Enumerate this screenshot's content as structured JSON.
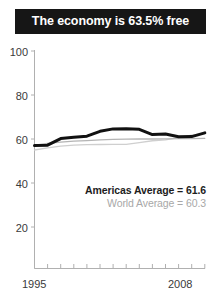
{
  "title": "The economy is 63.5% free",
  "legend": {
    "americas": "Americas Average = 61.6",
    "world": "World Average = 60.3"
  },
  "axis": {
    "y_ticks": [
      "100",
      "80",
      "60",
      "40",
      "20"
    ],
    "x_start": "1995",
    "x_end": "2008"
  },
  "colors": {
    "title_bar": "#161616",
    "title_text": "#ffffff",
    "americas_line": "#111111",
    "world_line": "#b4b4b4",
    "country_line": "#8c8c8c",
    "axis": "#b0b0b0",
    "tick_text": "#3a3a3a"
  },
  "chart_data": {
    "type": "line",
    "title": "The economy is 63.5% free",
    "xlabel": "",
    "ylabel": "",
    "x": [
      1995,
      1996,
      1997,
      1998,
      1999,
      2000,
      2001,
      2002,
      2003,
      2004,
      2005,
      2006,
      2007,
      2008
    ],
    "xlim": [
      1995,
      2008
    ],
    "ylim": [
      0,
      100
    ],
    "yticks": [
      20,
      40,
      60,
      80,
      100
    ],
    "grid": false,
    "legend_position": "inside-bottom-right",
    "series": [
      {
        "name": "Americas Average",
        "color": "#111111",
        "width": 3,
        "label_value": 61.6,
        "values": [
          57.0,
          57.2,
          60.2,
          60.8,
          61.3,
          63.5,
          64.6,
          64.7,
          64.4,
          62.0,
          62.3,
          61.0,
          61.1,
          62.8
        ]
      },
      {
        "name": "World Average",
        "color": "#b4b4b4",
        "width": 1.3,
        "label_value": 60.3,
        "values": [
          57.2,
          58.0,
          58.6,
          59.0,
          59.3,
          59.6,
          59.8,
          59.9,
          60.0,
          60.0,
          60.1,
          60.2,
          60.2,
          60.3
        ]
      },
      {
        "name": "Country",
        "color": "#cfcfcf",
        "width": 1.3,
        "label_value": 63.5,
        "values": [
          55.0,
          56.0,
          56.8,
          57.2,
          57.4,
          57.5,
          57.6,
          57.6,
          58.4,
          59.2,
          59.6,
          60.6,
          61.8,
          62.5
        ]
      }
    ]
  }
}
